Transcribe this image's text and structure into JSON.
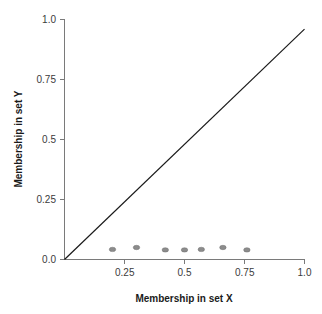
{
  "chart_data": {
    "type": "scatter",
    "title": "",
    "subtitle": "",
    "xlabel": "Membership in set X",
    "ylabel": "Membership in set Y",
    "xlim": [
      0.0,
      1.0
    ],
    "ylim": [
      0.0,
      1.0
    ],
    "grid": false,
    "legend": null,
    "x_ticks": [
      0.25,
      0.5,
      0.75,
      1.0
    ],
    "x_tick_labels": [
      "0.25",
      "0.5",
      "0.75",
      "1.0"
    ],
    "y_ticks": [
      0.0,
      0.25,
      0.5,
      0.75,
      1.0
    ],
    "y_tick_labels": [
      "0.0",
      "0.25",
      "0.5",
      "0.75",
      "1.0"
    ],
    "series": [
      {
        "name": "data-points",
        "marker": "ellipse",
        "color": "#8c8c8c",
        "points": [
          {
            "x": 0.2,
            "y": 0.042
          },
          {
            "x": 0.3,
            "y": 0.05
          },
          {
            "x": 0.42,
            "y": 0.04
          },
          {
            "x": 0.5,
            "y": 0.04
          },
          {
            "x": 0.57,
            "y": 0.042
          },
          {
            "x": 0.66,
            "y": 0.05
          },
          {
            "x": 0.76,
            "y": 0.04
          }
        ]
      },
      {
        "name": "diagonal-reference-line",
        "marker": "line",
        "color": "#1a1a1a",
        "points": [
          {
            "x": 0.0,
            "y": 0.0
          },
          {
            "x": 1.0,
            "y": 0.96
          }
        ]
      }
    ]
  },
  "axes": {
    "x_title": "Membership in set X",
    "y_title": "Membership in set Y"
  }
}
